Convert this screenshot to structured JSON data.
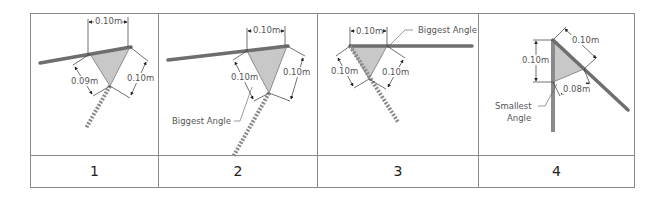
{
  "figure": {
    "panels": [
      {
        "number": "1",
        "dimensions": {
          "top": "0.10m",
          "left": "0.09m",
          "right": "0.10m"
        },
        "annotation": ""
      },
      {
        "number": "2",
        "dimensions": {
          "top": "0.10m",
          "left": "0.10m",
          "right": "0.10m"
        },
        "annotation": "Biggest Angle"
      },
      {
        "number": "3",
        "dimensions": {
          "top": "0.10m",
          "left": "0.10m",
          "right": "0.10m"
        },
        "annotation": "Biggest Angle"
      },
      {
        "number": "4",
        "dimensions": {
          "left": "0.10m",
          "top_right": "0.10m",
          "bottom": "0.08m"
        },
        "annotation_line1": "Smallest",
        "annotation_line2": "Angle"
      }
    ]
  },
  "colors": {
    "border": "#8a8a8a",
    "beam": "#6e6e6e",
    "triangle_fill": "#c8c8c8",
    "dimension_line": "#333333",
    "text": "#555555"
  }
}
